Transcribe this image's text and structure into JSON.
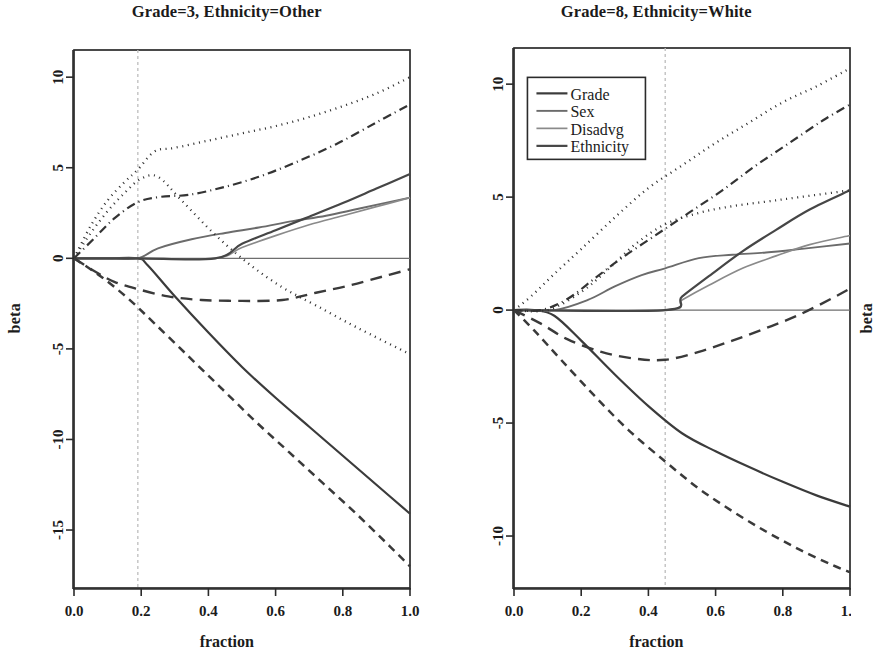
{
  "figure": {
    "xlabel": "fraction",
    "ylabel": "beta"
  },
  "chart_data": [
    {
      "type": "line",
      "panel": "left",
      "title": "Grade=3, Ethnicity=Other",
      "xlabel": "fraction",
      "ylabel": "beta",
      "xlim": [
        0.0,
        1.0
      ],
      "ylim": [
        -18.2,
        11.5
      ],
      "xticks": [
        0.0,
        0.2,
        0.4,
        0.6,
        0.8,
        1.0
      ],
      "xticklabels": [
        "0.0",
        "0.2",
        "0.4",
        "0.6",
        "0.8",
        "1.0"
      ],
      "yticks": [
        10,
        5,
        0,
        -5,
        -10,
        -15
      ],
      "yticklabels": [
        "10",
        "5",
        "0",
        "-5",
        "-10",
        "-15"
      ],
      "grid": false,
      "vline": 0.19,
      "hline": 0,
      "legend_position": "none",
      "series": [
        {
          "name": "Grade",
          "style": "solid",
          "color": "#3b3b3b",
          "width": 2.2,
          "x": [
            0.0,
            0.1,
            0.19,
            0.22,
            0.3,
            0.4,
            0.5,
            0.6,
            0.7,
            0.8,
            0.9,
            1.0
          ],
          "y": [
            0.0,
            0.0,
            0.0,
            -0.4,
            -2.1,
            -4.1,
            -6.0,
            -7.7,
            -9.3,
            -10.9,
            -12.5,
            -14.1
          ]
        },
        {
          "name": "Sex",
          "style": "solid",
          "color": "#6b6b6b",
          "width": 1.9,
          "x": [
            0.0,
            0.1,
            0.19,
            0.25,
            0.35,
            0.45,
            0.55,
            0.65,
            0.75,
            0.85,
            1.0
          ],
          "y": [
            0.0,
            0.0,
            0.0,
            0.55,
            1.05,
            1.4,
            1.7,
            2.05,
            2.35,
            2.75,
            3.35
          ]
        },
        {
          "name": "Disadvg",
          "style": "solid",
          "color": "#8a8a8a",
          "width": 1.7,
          "x": [
            0.0,
            0.19,
            0.42,
            0.5,
            0.6,
            0.7,
            0.8,
            0.9,
            1.0
          ],
          "y": [
            0.0,
            0.0,
            0.0,
            0.6,
            1.25,
            1.85,
            2.35,
            2.85,
            3.35
          ]
        },
        {
          "name": "Ethnicity",
          "style": "solid",
          "color": "#464646",
          "width": 2.2,
          "x": [
            0.0,
            0.19,
            0.42,
            0.5,
            0.6,
            0.7,
            0.8,
            0.9,
            1.0
          ],
          "y": [
            0.0,
            0.0,
            0.0,
            0.8,
            1.55,
            2.3,
            3.05,
            3.85,
            4.65
          ]
        },
        {
          "name": "Grade upper band",
          "style": "dotted",
          "color": "#2f2f2f",
          "width": 2.3,
          "x": [
            0.0,
            0.05,
            0.1,
            0.15,
            0.19,
            0.24,
            0.3,
            0.4,
            0.5,
            0.6,
            0.7,
            0.8,
            0.9,
            1.0
          ],
          "y": [
            0.0,
            1.8,
            3.2,
            4.2,
            4.9,
            5.9,
            6.1,
            6.5,
            6.9,
            7.3,
            7.8,
            8.4,
            9.1,
            10.0
          ]
        },
        {
          "name": "Grade lower band",
          "style": "dashed-long",
          "color": "#3a3a3a",
          "width": 2.4,
          "x": [
            0.0,
            0.06,
            0.12,
            0.19,
            0.28,
            0.38,
            0.5,
            0.62,
            0.72,
            0.82,
            0.92,
            1.0
          ],
          "y": [
            0.0,
            -0.7,
            -1.3,
            -1.7,
            -2.1,
            -2.3,
            -2.35,
            -2.3,
            -1.9,
            -1.5,
            -1.0,
            -0.6
          ]
        },
        {
          "name": "Sex band upper",
          "style": "dashdot",
          "color": "#343434",
          "width": 2.2,
          "x": [
            0.0,
            0.06,
            0.12,
            0.19,
            0.26,
            0.34,
            0.44,
            0.55,
            0.66,
            0.78,
            0.9,
            1.0
          ],
          "y": [
            0.0,
            1.1,
            2.2,
            3.1,
            3.4,
            3.5,
            3.9,
            4.5,
            5.3,
            6.3,
            7.5,
            8.5
          ]
        },
        {
          "name": "Disadvg band",
          "style": "dotted",
          "color": "#2f2f2f",
          "width": 2.3,
          "x": [
            0.0,
            0.05,
            0.1,
            0.15,
            0.2,
            0.25,
            0.32,
            0.42,
            0.52,
            0.62,
            0.72,
            0.84,
            1.0
          ],
          "y": [
            0.0,
            1.4,
            2.6,
            3.6,
            4.4,
            4.5,
            3.2,
            1.3,
            -0.3,
            -1.6,
            -2.6,
            -3.8,
            -5.3
          ]
        },
        {
          "name": "Ethnicity lower band",
          "style": "dashed",
          "color": "#3a3a3a",
          "width": 2.5,
          "x": [
            0.0,
            0.08,
            0.16,
            0.24,
            0.34,
            0.44,
            0.54,
            0.64,
            0.74,
            0.84,
            0.94,
            1.0
          ],
          "y": [
            0.0,
            -1.0,
            -2.2,
            -3.6,
            -5.4,
            -7.2,
            -9.0,
            -10.7,
            -12.4,
            -14.1,
            -15.9,
            -17.0
          ]
        }
      ]
    },
    {
      "type": "line",
      "panel": "right",
      "title": "Grade=8, Ethnicity=White",
      "xlabel": "fraction",
      "ylabel": "beta",
      "xlim": [
        0.0,
        1.0
      ],
      "ylim": [
        -12.3,
        11.6
      ],
      "xticks": [
        0.0,
        0.2,
        0.4,
        0.6,
        0.8,
        1.0
      ],
      "xticklabels": [
        "0.0",
        "0.2",
        "0.4",
        "0.6",
        "0.8",
        "1.0"
      ],
      "yticks": [
        10,
        5,
        0,
        -5,
        -10
      ],
      "yticklabels": [
        "10",
        "5",
        "0",
        "-5",
        "-10"
      ],
      "grid": false,
      "vline": 0.45,
      "hline": 0,
      "legend_position": "upper left",
      "legend_entries": [
        "Grade",
        "Sex",
        "Disadvg",
        "Ethnicity"
      ],
      "series": [
        {
          "name": "Grade",
          "style": "solid",
          "color": "#3b3b3b",
          "width": 2.2,
          "x": [
            0.0,
            0.06,
            0.12,
            0.2,
            0.3,
            0.4,
            0.5,
            0.6,
            0.7,
            0.8,
            0.9,
            1.0
          ],
          "y": [
            0.0,
            0.0,
            -0.25,
            -1.35,
            -2.85,
            -4.25,
            -5.45,
            -6.25,
            -6.95,
            -7.6,
            -8.2,
            -8.7
          ]
        },
        {
          "name": "Sex",
          "style": "solid",
          "color": "#6b6b6b",
          "width": 1.9,
          "x": [
            0.0,
            0.12,
            0.22,
            0.3,
            0.38,
            0.45,
            0.55,
            0.65,
            0.75,
            0.85,
            1.0
          ],
          "y": [
            0.0,
            0.0,
            0.45,
            1.05,
            1.55,
            1.85,
            2.3,
            2.45,
            2.55,
            2.7,
            2.95
          ]
        },
        {
          "name": "Disadvg",
          "style": "solid",
          "color": "#8a8a8a",
          "width": 1.7,
          "x": [
            0.0,
            0.45,
            0.5,
            0.58,
            0.68,
            0.78,
            0.88,
            1.0
          ],
          "y": [
            0.0,
            0.0,
            0.45,
            1.1,
            1.85,
            2.4,
            2.9,
            3.3
          ]
        },
        {
          "name": "Ethnicity",
          "style": "solid",
          "color": "#464646",
          "width": 2.2,
          "x": [
            0.0,
            0.45,
            0.5,
            0.58,
            0.68,
            0.78,
            0.88,
            1.0
          ],
          "y": [
            0.0,
            0.0,
            0.6,
            1.5,
            2.6,
            3.55,
            4.45,
            5.3
          ]
        },
        {
          "name": "Grade upper band",
          "style": "dotted",
          "color": "#2f2f2f",
          "width": 2.3,
          "x": [
            0.0,
            0.05,
            0.12,
            0.2,
            0.3,
            0.4,
            0.5,
            0.6,
            0.7,
            0.8,
            0.9,
            1.0
          ],
          "y": [
            0.0,
            0.6,
            1.6,
            2.7,
            4.1,
            5.4,
            6.4,
            7.4,
            8.3,
            9.2,
            9.9,
            10.7
          ]
        },
        {
          "name": "Sex band upper",
          "style": "dashdot",
          "color": "#343434",
          "width": 2.2,
          "x": [
            0.0,
            0.08,
            0.16,
            0.24,
            0.32,
            0.42,
            0.52,
            0.62,
            0.72,
            0.82,
            0.92,
            1.0
          ],
          "y": [
            0.0,
            0.0,
            0.5,
            1.4,
            2.3,
            3.3,
            4.3,
            5.3,
            6.4,
            7.4,
            8.4,
            9.1
          ]
        },
        {
          "name": "Disadvg band",
          "style": "dotted",
          "color": "#2f2f2f",
          "width": 2.3,
          "x": [
            0.0,
            0.1,
            0.2,
            0.28,
            0.36,
            0.45,
            0.55,
            0.65,
            0.75,
            0.85,
            1.0
          ],
          "y": [
            0.0,
            0.0,
            0.8,
            1.8,
            2.9,
            3.8,
            4.3,
            4.6,
            4.8,
            5.0,
            5.3
          ]
        },
        {
          "name": "Grade lower band",
          "style": "dashed-long",
          "color": "#3a3a3a",
          "width": 2.4,
          "x": [
            0.0,
            0.08,
            0.16,
            0.26,
            0.36,
            0.45,
            0.55,
            0.65,
            0.75,
            0.85,
            0.95,
            1.0
          ],
          "y": [
            0.0,
            -0.6,
            -1.3,
            -1.85,
            -2.15,
            -2.2,
            -1.85,
            -1.35,
            -0.8,
            -0.2,
            0.55,
            0.95
          ]
        },
        {
          "name": "Ethnicity lower band",
          "style": "dashed",
          "color": "#3a3a3a",
          "width": 2.5,
          "x": [
            0.0,
            0.06,
            0.14,
            0.24,
            0.34,
            0.45,
            0.55,
            0.65,
            0.75,
            0.85,
            0.95,
            1.0
          ],
          "y": [
            0.0,
            -0.9,
            -2.2,
            -3.8,
            -5.3,
            -6.7,
            -7.9,
            -8.9,
            -9.8,
            -10.6,
            -11.3,
            -11.6
          ]
        }
      ]
    }
  ]
}
